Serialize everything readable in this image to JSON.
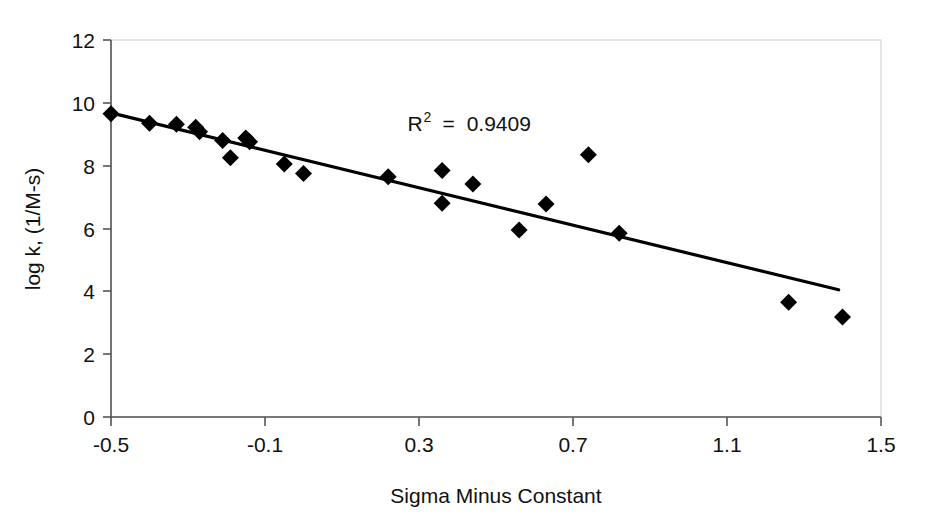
{
  "chart_data": {
    "type": "scatter",
    "title": "",
    "xlabel": "Sigma Minus Constant",
    "ylabel": "log k, (1/M-s)",
    "xlim": [
      -0.5,
      1.5
    ],
    "ylim": [
      0,
      12
    ],
    "xticks": [
      "-0.5",
      "-0.1",
      "0.3",
      "0.7",
      "1.1",
      "1.5"
    ],
    "xtick_values": [
      -0.5,
      -0.1,
      0.3,
      0.7,
      1.1,
      1.5
    ],
    "yticks": [
      "0",
      "2",
      "4",
      "6",
      "8",
      "10",
      "12"
    ],
    "ytick_values": [
      0,
      2,
      4,
      6,
      8,
      10,
      12
    ],
    "grid": false,
    "legend": "none",
    "marker": "filled-diamond",
    "marker_color": "#000000",
    "points": [
      {
        "x": -0.5,
        "y": 9.65
      },
      {
        "x": -0.4,
        "y": 9.35
      },
      {
        "x": -0.33,
        "y": 9.32
      },
      {
        "x": -0.28,
        "y": 9.22
      },
      {
        "x": -0.27,
        "y": 9.08
      },
      {
        "x": -0.21,
        "y": 8.8
      },
      {
        "x": -0.19,
        "y": 8.25
      },
      {
        "x": -0.15,
        "y": 8.88
      },
      {
        "x": -0.14,
        "y": 8.76
      },
      {
        "x": -0.05,
        "y": 8.05
      },
      {
        "x": 0.0,
        "y": 7.75
      },
      {
        "x": 0.22,
        "y": 7.65
      },
      {
        "x": 0.36,
        "y": 7.85
      },
      {
        "x": 0.36,
        "y": 6.8
      },
      {
        "x": 0.44,
        "y": 7.42
      },
      {
        "x": 0.56,
        "y": 5.95
      },
      {
        "x": 0.63,
        "y": 6.78
      },
      {
        "x": 0.74,
        "y": 8.35
      },
      {
        "x": 0.82,
        "y": 5.85
      },
      {
        "x": 1.26,
        "y": 3.65
      },
      {
        "x": 1.4,
        "y": 3.18
      }
    ],
    "trendline": {
      "x_start": -0.5,
      "y_start": 9.68,
      "x_end": 1.39,
      "y_end": 4.05,
      "color": "#000000"
    },
    "annotations": [
      {
        "name": "r-squared",
        "prefix": "R",
        "superscript": "2",
        "equals": "=",
        "value": "0.9409",
        "x": 0.27,
        "y": 9.1
      }
    ]
  }
}
